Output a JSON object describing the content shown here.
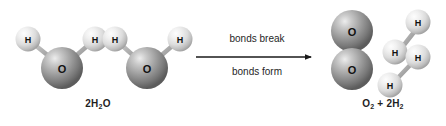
{
  "diagram": {
    "background_color": "#ffffff",
    "atom_colors": {
      "oxygen": "#9a9a9a",
      "oxygen_highlight": "#e8e8e8",
      "oxygen_shadow": "#5f5f5f",
      "hydrogen": "#e2e2e2",
      "hydrogen_highlight": "#fbfbfb",
      "hydrogen_shadow": "#9c9c9c",
      "bond": "#8e8e8e",
      "text": "#1a1a1a"
    }
  },
  "reactants": {
    "formula_text": "2H2O",
    "formula_prefix": "2H",
    "formula_sub": "2",
    "formula_suffix": "O",
    "molecules": [
      {
        "name": "water-molecule-1",
        "atoms": [
          {
            "element": "O",
            "label": "O"
          },
          {
            "element": "H",
            "label": "H"
          },
          {
            "element": "H",
            "label": "H"
          }
        ]
      },
      {
        "name": "water-molecule-2",
        "atoms": [
          {
            "element": "O",
            "label": "O"
          },
          {
            "element": "H",
            "label": "H"
          },
          {
            "element": "H",
            "label": "H"
          }
        ]
      }
    ]
  },
  "arrow": {
    "label_top": "bonds break",
    "label_bottom": "bonds form",
    "direction": "right"
  },
  "products": {
    "formula_prefix": "O",
    "formula_sub1": "2",
    "formula_middle": " + 2H",
    "formula_sub2": "2",
    "molecules": [
      {
        "name": "oxygen-molecule",
        "atoms": [
          {
            "element": "O",
            "label": "O"
          },
          {
            "element": "O",
            "label": "O"
          }
        ]
      },
      {
        "name": "hydrogen-molecule-1",
        "atoms": [
          {
            "element": "H",
            "label": "H"
          },
          {
            "element": "H",
            "label": "H"
          }
        ]
      },
      {
        "name": "hydrogen-molecule-2",
        "atoms": [
          {
            "element": "H",
            "label": "H"
          },
          {
            "element": "H",
            "label": "H"
          }
        ]
      }
    ]
  }
}
